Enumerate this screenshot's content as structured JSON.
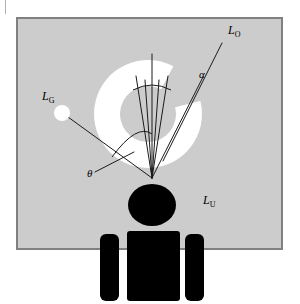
{
  "figure": {
    "canvas": {
      "width": 300,
      "height": 304,
      "background": "#ffffff"
    },
    "panel": {
      "name": "scene-panel",
      "x": 16,
      "y": 17,
      "width": 267,
      "height": 233,
      "fill": "#cccccc",
      "border_color": "#808080",
      "border_width": 2
    },
    "highlight": {
      "name": "specular-highlight-annulus",
      "cx": 148,
      "cy": 114,
      "outer_r": 54,
      "inner_r": 28,
      "fill": "#ffffff",
      "inner_fill": "#cccccc",
      "gap_start_deg": -62,
      "gap_end_deg": -14
    },
    "light_source": {
      "name": "point-light-dot",
      "cx": 62,
      "cy": 113,
      "r": 8,
      "fill": "#ffffff"
    },
    "observer": {
      "name": "observer-figure",
      "fill": "#000000",
      "head": {
        "cx": 152,
        "cy": 205,
        "rx": 24,
        "ry": 21
      },
      "torso": {
        "x": 127,
        "y": 231,
        "width": 53,
        "height": 70,
        "radius": 3
      },
      "arm_left": {
        "x": 100,
        "y": 234,
        "width": 19,
        "height": 67,
        "radius": 6
      },
      "arm_right": {
        "x": 185,
        "y": 234,
        "width": 19,
        "height": 67,
        "radius": 6
      }
    },
    "vertex": {
      "name": "ray-convergence-point",
      "x": 152,
      "y": 178
    },
    "rays": [
      {
        "name": "ray-view-axis",
        "x1": 152,
        "y1": 178,
        "x2": 152,
        "y2": 54,
        "stroke": "#1a1a1a",
        "width": 1
      },
      {
        "name": "ray-cone-left",
        "x1": 152,
        "y1": 178,
        "x2": 136,
        "y2": 76,
        "stroke": "#1a1a1a",
        "width": 1
      },
      {
        "name": "ray-cone-right",
        "x1": 152,
        "y1": 178,
        "x2": 168,
        "y2": 76,
        "stroke": "#1a1a1a",
        "width": 1
      },
      {
        "name": "ray-cone-inner-left",
        "x1": 152,
        "y1": 178,
        "x2": 145,
        "y2": 80,
        "stroke": "#1a1a1a",
        "width": 1
      },
      {
        "name": "ray-cone-inner-right",
        "x1": 152,
        "y1": 178,
        "x2": 159,
        "y2": 80,
        "stroke": "#1a1a1a",
        "width": 1
      },
      {
        "name": "ray-outgoing-lo",
        "x1": 163,
        "y1": 161,
        "x2": 222,
        "y2": 43,
        "stroke": "#1a1a1a",
        "width": 1
      },
      {
        "name": "ray-alpha-direction",
        "x1": 152,
        "y1": 178,
        "x2": 203,
        "y2": 77,
        "stroke": "#1a1a1a",
        "width": 1
      },
      {
        "name": "ray-incoming-lg",
        "x1": 152,
        "y1": 178,
        "x2": 68,
        "y2": 117,
        "stroke": "#1a1a1a",
        "width": 1
      },
      {
        "name": "ray-theta-leader",
        "x1": 95,
        "y1": 172,
        "x2": 134,
        "y2": 152,
        "stroke": "#1a1a1a",
        "width": 1
      }
    ],
    "arcs": [
      {
        "name": "arc-cone-aperture",
        "d": "M 133 90 Q 152 80 171 90",
        "stroke": "#1a1a1a",
        "width": 1
      },
      {
        "name": "arc-theta",
        "d": "M 112 157 Q 137 123 152 134",
        "stroke": "#1a1a1a",
        "width": 1
      }
    ],
    "labels": [
      {
        "name": "label-lo",
        "base": "L",
        "sub": "O",
        "x": 228,
        "y": 34,
        "sub_dx": 7,
        "sub_dy": 3
      },
      {
        "name": "label-alpha",
        "glyph": "α",
        "x": 199,
        "y": 78
      },
      {
        "name": "label-lg",
        "base": "L",
        "sub": "G",
        "x": 42,
        "y": 100,
        "sub_dx": 7,
        "sub_dy": 3
      },
      {
        "name": "label-theta",
        "glyph": "θ",
        "x": 87,
        "y": 177
      },
      {
        "name": "label-lu",
        "base": "L",
        "sub": "U",
        "x": 203,
        "y": 204,
        "sub_dx": 7,
        "sub_dy": 3
      }
    ],
    "corner_mark": {
      "name": "page-corner-rule",
      "x": 5,
      "y": 0,
      "width": 1,
      "height": 14,
      "fill": "#b0b0b0"
    }
  }
}
